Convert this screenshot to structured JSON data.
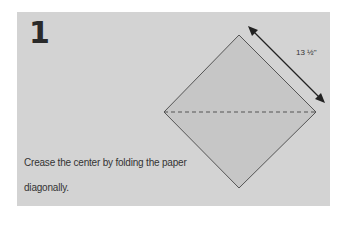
{
  "step": {
    "number": "1"
  },
  "instruction": "Crease the center by folding the paper diagonally.",
  "figure": {
    "dimension_label": "13 ½\"",
    "colors": {
      "panel": "#d3d3d3",
      "paper": "#c6c6c6",
      "outline": "#555555",
      "arrow": "#222222"
    }
  }
}
